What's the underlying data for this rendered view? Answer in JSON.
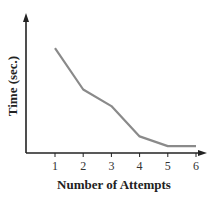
{
  "chart_data": {
    "type": "line",
    "title": "",
    "xlabel": "Number of Attempts",
    "ylabel": "Time (sec.)",
    "categories": [
      1,
      2,
      3,
      4,
      5,
      6
    ],
    "x": [
      1,
      2,
      3,
      4,
      5,
      6
    ],
    "series": [
      {
        "name": "Time",
        "values": [
          7.6,
          4.6,
          3.4,
          1.2,
          0.5,
          0.5
        ]
      }
    ],
    "ylim": [
      0,
      10
    ],
    "y_tick_labels": [],
    "grid": false,
    "legend": null,
    "colors": {
      "line": "#8a8a8a",
      "axis": "#222222"
    },
    "note": "Y values are relative (no y-axis tick labels shown); decreasing trend that levels off at attempts 5-6."
  }
}
